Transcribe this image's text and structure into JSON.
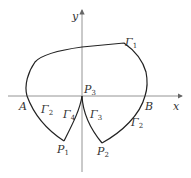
{
  "axes": {
    "x_label": "x",
    "y_label": "y"
  },
  "points": {
    "A": "A",
    "B": "B",
    "P1": {
      "base": "P",
      "sub": "1"
    },
    "P2": {
      "base": "P",
      "sub": "2"
    },
    "P3": {
      "base": "P",
      "sub": "3"
    }
  },
  "curves": {
    "gamma1": {
      "base": "Γ",
      "sub": "1"
    },
    "gamma2_left": {
      "base": "Γ",
      "sub": "2"
    },
    "gamma2_right": {
      "base": "Γ",
      "sub": "2"
    },
    "gamma3": {
      "base": "Γ",
      "sub": "3"
    },
    "gamma4": {
      "base": "Γ",
      "sub": "4"
    }
  },
  "colors": {
    "curve": "#222222",
    "axis": "#888888"
  }
}
